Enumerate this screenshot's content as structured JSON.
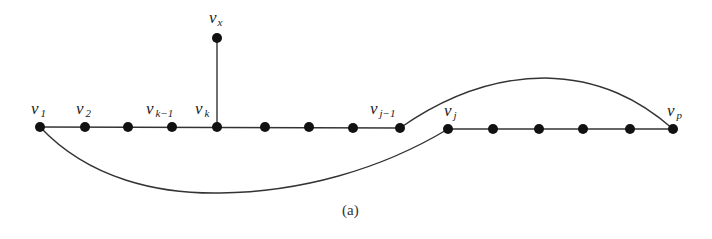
{
  "figure": {
    "caption": "(a)",
    "edge_color": "#333333",
    "node_color": "#111111"
  },
  "nodes": [
    {
      "id": "v1",
      "base": "v",
      "sub": "1",
      "x": 40,
      "y": 127
    },
    {
      "id": "v2",
      "base": "v",
      "sub": "2",
      "x": 85,
      "y": 127
    },
    {
      "id": "n3",
      "base": "",
      "sub": "",
      "x": 128,
      "y": 127
    },
    {
      "id": "vk-1",
      "base": "v",
      "sub": "k−1",
      "x": 172,
      "y": 127
    },
    {
      "id": "vk",
      "base": "v",
      "sub": "k",
      "x": 217,
      "y": 127
    },
    {
      "id": "n6",
      "base": "",
      "sub": "",
      "x": 265,
      "y": 127
    },
    {
      "id": "n7",
      "base": "",
      "sub": "",
      "x": 309,
      "y": 127
    },
    {
      "id": "n8",
      "base": "",
      "sub": "",
      "x": 353,
      "y": 128
    },
    {
      "id": "vj-1",
      "base": "v",
      "sub": "j−1",
      "x": 400,
      "y": 128
    },
    {
      "id": "vj",
      "base": "v",
      "sub": "j",
      "x": 448,
      "y": 129
    },
    {
      "id": "n11",
      "base": "",
      "sub": "",
      "x": 493,
      "y": 129
    },
    {
      "id": "n12",
      "base": "",
      "sub": "",
      "x": 539,
      "y": 129
    },
    {
      "id": "n13",
      "base": "",
      "sub": "",
      "x": 583,
      "y": 129
    },
    {
      "id": "n14",
      "base": "",
      "sub": "",
      "x": 630,
      "y": 129
    },
    {
      "id": "vp",
      "base": "v",
      "sub": "p",
      "x": 673,
      "y": 129
    },
    {
      "id": "vx",
      "base": "v",
      "sub": "x",
      "x": 217,
      "y": 38
    }
  ],
  "labels": {
    "v1": {
      "base": "v",
      "sub": "1"
    },
    "v2": {
      "base": "v",
      "sub": "2"
    },
    "vk1": {
      "base": "v",
      "sub": "k−1"
    },
    "vk": {
      "base": "v",
      "sub": "k"
    },
    "vj1": {
      "base": "v",
      "sub": "j−1"
    },
    "vj": {
      "base": "v",
      "sub": "j"
    },
    "vp": {
      "base": "v",
      "sub": "p"
    },
    "vx": {
      "base": "v",
      "sub": "x"
    }
  },
  "edges": [
    {
      "from": "v1",
      "to": "vj-1",
      "type": "path"
    },
    {
      "from": "vj",
      "to": "vp",
      "type": "path"
    },
    {
      "from": "vk",
      "to": "vx",
      "type": "straight"
    },
    {
      "from": "v1",
      "to": "vj",
      "type": "curve-below"
    },
    {
      "from": "vj-1",
      "to": "vp",
      "type": "curve-above"
    }
  ]
}
